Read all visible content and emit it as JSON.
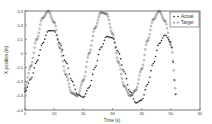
{
  "chart_data": {
    "type": "scatter",
    "title": "",
    "xlabel": "Time (s)",
    "ylabel": "X position (m)",
    "xlim": [
      0,
      60
    ],
    "ylim": [
      -0.4,
      0.3
    ],
    "xticks": [
      "0",
      "10",
      "20",
      "30",
      "40",
      "50",
      "60"
    ],
    "yticks": [
      "0.3",
      "0.2",
      "0.1",
      "0",
      "-0.1",
      "-0.2",
      "-0.3",
      "-0.4"
    ],
    "grid": false,
    "legend_position": "upper right",
    "series": [
      {
        "name": "Actual",
        "marker": "dot",
        "color": "#222222",
        "x": [
          0,
          2,
          4,
          6,
          8,
          10,
          12,
          14,
          16,
          18,
          20,
          22,
          24,
          26,
          28,
          30,
          32,
          34,
          36,
          38,
          40,
          42,
          44,
          46,
          48,
          50,
          52
        ],
        "y": [
          -0.27,
          -0.18,
          -0.06,
          0.07,
          0.16,
          0.16,
          0.07,
          -0.06,
          -0.19,
          -0.29,
          -0.31,
          -0.24,
          -0.1,
          0.04,
          0.12,
          0.11,
          0.01,
          -0.13,
          -0.27,
          -0.35,
          -0.33,
          -0.22,
          -0.07,
          0.07,
          0.13,
          0.08,
          -0.33
        ]
      },
      {
        "name": "Target",
        "marker": "circle",
        "color": "#666666",
        "x": [
          0,
          2,
          4,
          6,
          8,
          10,
          12,
          14,
          16,
          18,
          20,
          22,
          24,
          26,
          28,
          30,
          32,
          34,
          36,
          38,
          40,
          42,
          44,
          46,
          48,
          50,
          52
        ],
        "y": [
          -0.25,
          -0.09,
          0.1,
          0.25,
          0.3,
          0.22,
          0.04,
          -0.15,
          -0.28,
          -0.3,
          -0.19,
          0.0,
          0.18,
          0.29,
          0.28,
          0.14,
          -0.06,
          -0.23,
          -0.3,
          -0.26,
          -0.11,
          0.09,
          0.24,
          0.3,
          0.23,
          0.06,
          -0.3
        ]
      }
    ]
  },
  "legend": {
    "items": [
      {
        "label": "Actual"
      },
      {
        "label": "Target"
      }
    ]
  }
}
